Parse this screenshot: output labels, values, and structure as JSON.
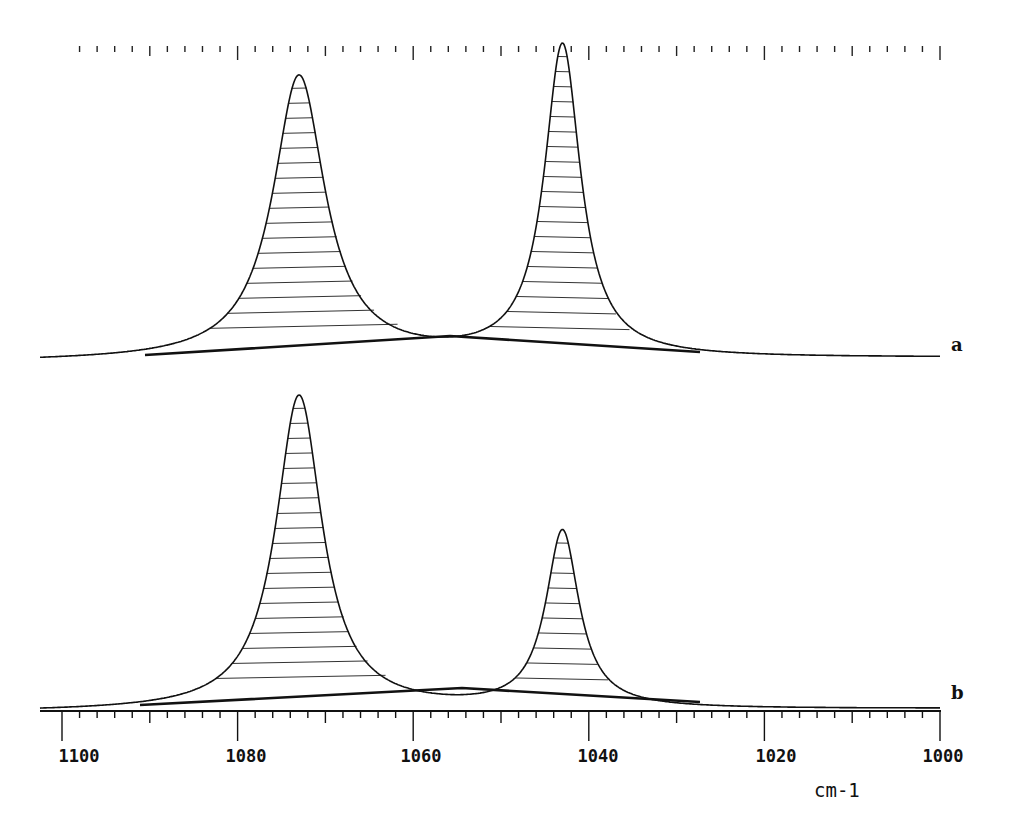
{
  "chart_data": {
    "type": "line",
    "title": "",
    "xlabel": "cm-1",
    "ylabel": "",
    "x_axis": {
      "reversed": true,
      "range": [
        1100,
        1000
      ],
      "major_ticks": [
        1100,
        1080,
        1060,
        1040,
        1020,
        1000
      ],
      "tick_labels": [
        "1100",
        "1080",
        "1060",
        "1040",
        "1020",
        "1000"
      ],
      "minor_tick_step": 2,
      "mid_tick_step": 10
    },
    "grid": false,
    "legend": null,
    "series": [
      {
        "name": "a",
        "label": "a",
        "description": "Band-fitted spectrum with two hatched Lorentzian peaks and fitted linear baseline",
        "peaks": [
          {
            "center_cm1": 1073,
            "relative_height": 0.91,
            "fwhm_cm1": 7.2
          },
          {
            "center_cm1": 1043,
            "relative_height": 1.0,
            "fwhm_cm1": 5.0
          }
        ],
        "minimum_between_peaks_cm1": 1054.5
      },
      {
        "name": "b",
        "label": "b",
        "description": "Band-fitted spectrum with two hatched Lorentzian peaks and fitted linear baseline",
        "peaks": [
          {
            "center_cm1": 1073,
            "relative_height": 1.0,
            "fwhm_cm1": 6.4
          },
          {
            "center_cm1": 1043,
            "relative_height": 0.55,
            "fwhm_cm1": 4.6
          }
        ],
        "minimum_between_peaks_cm1": 1054
      }
    ]
  },
  "labels": {
    "unit": "cm-1",
    "trace_a": "a",
    "trace_b": "b",
    "ticks": [
      "1100",
      "1080",
      "1060",
      "1040",
      "1020",
      "1000"
    ]
  },
  "render": {
    "px_per_cm1": 8.78,
    "x_at_1100": 62,
    "traces": [
      {
        "key": "a",
        "x_start": 40,
        "x_end": 940,
        "base_left": 362,
        "base_right": 358,
        "peaks": [
          {
            "center": 1073,
            "top": 77,
            "hwhm": 3.6
          },
          {
            "center": 1043,
            "top": 47,
            "hwhm": 2.5
          }
        ],
        "fit_baseline": [
          [
            145,
            355
          ],
          [
            450,
            336
          ],
          [
            700,
            352
          ]
        ],
        "hatch_step": 15,
        "label_pos": [
          951,
          352
        ]
      },
      {
        "key": "b",
        "x_start": 40,
        "x_end": 940,
        "base_left": 712,
        "base_right": 709,
        "peaks": [
          {
            "center": 1073,
            "top": 396,
            "hwhm": 3.2
          },
          {
            "center": 1043,
            "top": 533,
            "hwhm": 2.3
          }
        ],
        "fit_baseline": [
          [
            140,
            705
          ],
          [
            462,
            688
          ],
          [
            700,
            702
          ]
        ],
        "hatch_step": 15,
        "label_pos": [
          951,
          700
        ]
      }
    ],
    "top_axis_y": 46,
    "bottom_axis_y": 711
  }
}
